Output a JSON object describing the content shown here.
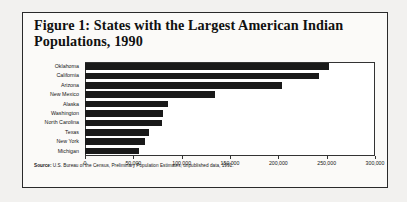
{
  "figure": {
    "title": "Figure 1:  States with the Largest American Indian Populations, 1990",
    "source_label": "Source:",
    "source_text": " U.S. Bureau of the Census, Preliminary Population Estimates, unpublished data, 1991."
  },
  "colors": {
    "bar": "#191919",
    "frame": "#2a2a2a",
    "axis": "#333333",
    "plot_background": "#ffffff",
    "figure_background": "#fbfaf8",
    "page_background": "#f2f1ef",
    "text": "#161616"
  },
  "chart_data": {
    "type": "bar",
    "orientation": "horizontal",
    "title": "Figure 1:  States with the Largest American Indian Populations, 1990",
    "xlabel": "",
    "ylabel": "",
    "categories": [
      "Oklahoma",
      "California",
      "Arizona",
      "New Mexico",
      "Alaska",
      "Washington",
      "North Carolina",
      "Texas",
      "New York",
      "Michigan"
    ],
    "values": [
      252000,
      242000,
      204000,
      134000,
      86000,
      81000,
      80000,
      66000,
      62000,
      56000
    ],
    "xlim": [
      0,
      300000
    ],
    "xticks": [
      0,
      50000,
      100000,
      150000,
      200000,
      250000,
      300000
    ],
    "xticklabels": [
      "0",
      "50,000",
      "100,000",
      "150,000",
      "200,000",
      "250,000",
      "300,000"
    ],
    "grid": false,
    "legend": null,
    "annotations": [
      "Source: U.S. Bureau of the Census, Preliminary Population Estimates, unpublished data, 1991."
    ]
  }
}
